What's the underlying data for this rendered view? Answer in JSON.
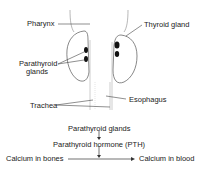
{
  "anatomy": {
    "labels": {
      "pharynx": "Pharynx",
      "thyroid_gland": "Thyroid gland",
      "parathyroid_line1": "Parathyroid",
      "parathyroid_line2": "glands",
      "trachea": "Trachea",
      "esophagus": "Esophagus"
    }
  },
  "flow": {
    "step1": "Parathyroid glands",
    "step2": "Parathyroid hormone (PTH)",
    "source": "Calcium in bones",
    "target": "Calcium in blood"
  },
  "colors": {
    "line": "#555555",
    "gland": "#111111",
    "text": "#222222"
  }
}
